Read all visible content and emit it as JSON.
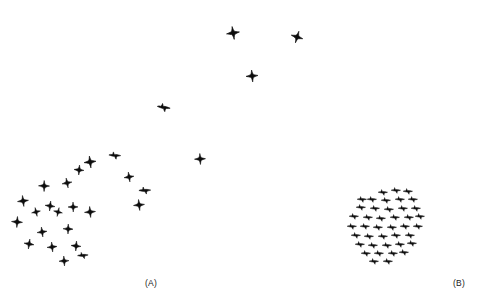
{
  "figure": {
    "background_color": "#ffffff",
    "bird_color": "#0d0d0d",
    "width": 493,
    "height": 301
  },
  "panels": [
    {
      "id": "A",
      "label": "(A)",
      "label_x": 145,
      "label_y": 278,
      "description": "sparse irregular flock"
    },
    {
      "id": "B",
      "label": "(B)",
      "label_x": 453,
      "label_y": 278,
      "description": "dense ordered flock"
    }
  ],
  "chart_data": {
    "type": "scatter",
    "title": "",
    "xlabel": "",
    "ylabel": "",
    "xlim": [
      0,
      493
    ],
    "ylim": [
      0,
      301
    ],
    "grid": false,
    "legend": null,
    "marker": "bird-silhouette",
    "series": [
      {
        "name": "(A)",
        "style": "star4",
        "count": 27,
        "points": [
          {
            "x": 233,
            "y": 33,
            "s": 13,
            "r": -8,
            "style": "star4"
          },
          {
            "x": 297,
            "y": 37,
            "s": 12,
            "r": 18,
            "style": "star4"
          },
          {
            "x": 252,
            "y": 76,
            "s": 12,
            "r": -4,
            "style": "star4"
          },
          {
            "x": 164,
            "y": 107,
            "s": 11,
            "r": 40,
            "style": "dart"
          },
          {
            "x": 200,
            "y": 159,
            "s": 11,
            "r": -2,
            "style": "star4"
          },
          {
            "x": 90,
            "y": 162,
            "s": 12,
            "r": -6,
            "style": "star4"
          },
          {
            "x": 115,
            "y": 155,
            "s": 10,
            "r": 35,
            "style": "dart"
          },
          {
            "x": 129,
            "y": 177,
            "s": 10,
            "r": -8,
            "style": "star4"
          },
          {
            "x": 145,
            "y": 190,
            "s": 10,
            "r": 30,
            "style": "dart"
          },
          {
            "x": 139,
            "y": 205,
            "s": 11,
            "r": -5,
            "style": "star4"
          },
          {
            "x": 79,
            "y": 170,
            "s": 10,
            "r": 6,
            "style": "star4"
          },
          {
            "x": 67,
            "y": 183,
            "s": 10,
            "r": -10,
            "style": "star4"
          },
          {
            "x": 44,
            "y": 186,
            "s": 11,
            "r": 2,
            "style": "star4"
          },
          {
            "x": 23,
            "y": 201,
            "s": 11,
            "r": -6,
            "style": "star4"
          },
          {
            "x": 50,
            "y": 206,
            "s": 10,
            "r": 8,
            "style": "star4"
          },
          {
            "x": 36,
            "y": 212,
            "s": 9,
            "r": -12,
            "style": "star4"
          },
          {
            "x": 73,
            "y": 207,
            "s": 10,
            "r": 0,
            "style": "star4"
          },
          {
            "x": 58,
            "y": 212,
            "s": 9,
            "r": 14,
            "style": "star4"
          },
          {
            "x": 90,
            "y": 212,
            "s": 11,
            "r": -4,
            "style": "star4"
          },
          {
            "x": 17,
            "y": 222,
            "s": 11,
            "r": 5,
            "style": "star4"
          },
          {
            "x": 42,
            "y": 232,
            "s": 10,
            "r": -7,
            "style": "star4"
          },
          {
            "x": 68,
            "y": 229,
            "s": 10,
            "r": 3,
            "style": "star4"
          },
          {
            "x": 29,
            "y": 244,
            "s": 10,
            "r": 10,
            "style": "star4"
          },
          {
            "x": 52,
            "y": 247,
            "s": 10,
            "r": -5,
            "style": "star4"
          },
          {
            "x": 76,
            "y": 246,
            "s": 10,
            "r": 6,
            "style": "star4"
          },
          {
            "x": 83,
            "y": 255,
            "s": 9,
            "r": 28,
            "style": "dart"
          },
          {
            "x": 64,
            "y": 261,
            "s": 10,
            "r": -3,
            "style": "star4"
          }
        ]
      },
      {
        "name": "(B)",
        "style": "dart",
        "count": 41,
        "points": [
          {
            "x": 383,
            "y": 192,
            "s": 8,
            "r": 32,
            "style": "dart"
          },
          {
            "x": 396,
            "y": 190,
            "s": 8,
            "r": 32,
            "style": "dart"
          },
          {
            "x": 372,
            "y": 199,
            "s": 8,
            "r": 32,
            "style": "dart"
          },
          {
            "x": 386,
            "y": 200,
            "s": 8,
            "r": 32,
            "style": "dart"
          },
          {
            "x": 400,
            "y": 199,
            "s": 8,
            "r": 32,
            "style": "dart"
          },
          {
            "x": 413,
            "y": 199,
            "s": 8,
            "r": 32,
            "style": "dart"
          },
          {
            "x": 361,
            "y": 207,
            "s": 8,
            "r": 32,
            "style": "dart"
          },
          {
            "x": 375,
            "y": 208,
            "s": 8,
            "r": 32,
            "style": "dart"
          },
          {
            "x": 389,
            "y": 209,
            "s": 8,
            "r": 32,
            "style": "dart"
          },
          {
            "x": 403,
            "y": 208,
            "s": 8,
            "r": 32,
            "style": "dart"
          },
          {
            "x": 416,
            "y": 208,
            "s": 8,
            "r": 32,
            "style": "dart"
          },
          {
            "x": 354,
            "y": 216,
            "s": 8,
            "r": 32,
            "style": "dart"
          },
          {
            "x": 368,
            "y": 217,
            "s": 8,
            "r": 32,
            "style": "dart"
          },
          {
            "x": 381,
            "y": 218,
            "s": 8,
            "r": 32,
            "style": "dart"
          },
          {
            "x": 395,
            "y": 217,
            "s": 8,
            "r": 32,
            "style": "dart"
          },
          {
            "x": 409,
            "y": 217,
            "s": 8,
            "r": 32,
            "style": "dart"
          },
          {
            "x": 420,
            "y": 216,
            "s": 8,
            "r": 32,
            "style": "dart"
          },
          {
            "x": 352,
            "y": 226,
            "s": 8,
            "r": 32,
            "style": "dart"
          },
          {
            "x": 365,
            "y": 226,
            "s": 8,
            "r": 32,
            "style": "dart"
          },
          {
            "x": 378,
            "y": 227,
            "s": 8,
            "r": 32,
            "style": "dart"
          },
          {
            "x": 392,
            "y": 227,
            "s": 8,
            "r": 32,
            "style": "dart"
          },
          {
            "x": 405,
            "y": 226,
            "s": 8,
            "r": 32,
            "style": "dart"
          },
          {
            "x": 418,
            "y": 226,
            "s": 8,
            "r": 32,
            "style": "dart"
          },
          {
            "x": 356,
            "y": 235,
            "s": 8,
            "r": 32,
            "style": "dart"
          },
          {
            "x": 369,
            "y": 236,
            "s": 8,
            "r": 32,
            "style": "dart"
          },
          {
            "x": 383,
            "y": 236,
            "s": 8,
            "r": 32,
            "style": "dart"
          },
          {
            "x": 396,
            "y": 235,
            "s": 8,
            "r": 32,
            "style": "dart"
          },
          {
            "x": 410,
            "y": 235,
            "s": 8,
            "r": 32,
            "style": "dart"
          },
          {
            "x": 360,
            "y": 244,
            "s": 8,
            "r": 32,
            "style": "dart"
          },
          {
            "x": 373,
            "y": 245,
            "s": 8,
            "r": 32,
            "style": "dart"
          },
          {
            "x": 387,
            "y": 245,
            "s": 8,
            "r": 32,
            "style": "dart"
          },
          {
            "x": 400,
            "y": 244,
            "s": 8,
            "r": 32,
            "style": "dart"
          },
          {
            "x": 412,
            "y": 243,
            "s": 8,
            "r": 32,
            "style": "dart"
          },
          {
            "x": 366,
            "y": 253,
            "s": 8,
            "r": 32,
            "style": "dart"
          },
          {
            "x": 379,
            "y": 253,
            "s": 8,
            "r": 32,
            "style": "dart"
          },
          {
            "x": 393,
            "y": 253,
            "s": 8,
            "r": 32,
            "style": "dart"
          },
          {
            "x": 404,
            "y": 252,
            "s": 8,
            "r": 32,
            "style": "dart"
          },
          {
            "x": 374,
            "y": 261,
            "s": 8,
            "r": 32,
            "style": "dart"
          },
          {
            "x": 388,
            "y": 261,
            "s": 8,
            "r": 32,
            "style": "dart"
          },
          {
            "x": 362,
            "y": 199,
            "s": 8,
            "r": 32,
            "style": "dart"
          },
          {
            "x": 408,
            "y": 191,
            "s": 8,
            "r": 32,
            "style": "dart"
          }
        ]
      }
    ]
  }
}
